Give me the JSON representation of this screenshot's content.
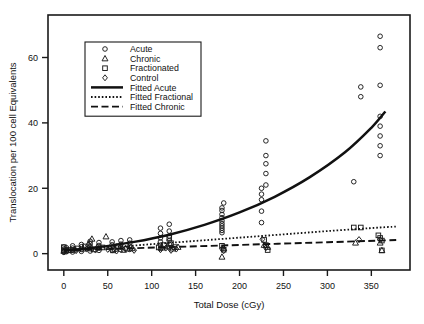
{
  "chart_data": {
    "type": "scatter",
    "title": "",
    "xlabel": "Total Dose (cGy)",
    "ylabel": "Translocation per 100 cell Equivalents",
    "xlim": [
      -18,
      394
    ],
    "ylim": [
      -5,
      73
    ],
    "xticks": [
      0,
      50,
      100,
      150,
      200,
      250,
      300,
      350
    ],
    "yticks": [
      0,
      20,
      40,
      60
    ],
    "grid": false,
    "legend_position": "upper-left",
    "legend": [
      {
        "label": "Acute",
        "marker": "circle",
        "kind": "marker"
      },
      {
        "label": "Chronic",
        "marker": "triangle",
        "kind": "marker"
      },
      {
        "label": "Fractionated",
        "marker": "square",
        "kind": "marker"
      },
      {
        "label": "Control",
        "marker": "diamond",
        "kind": "marker"
      },
      {
        "label": "Fitted Acute",
        "line": "solid",
        "kind": "line"
      },
      {
        "label": "Fitted Fractional",
        "line": "dotted",
        "kind": "line"
      },
      {
        "label": "Fitted Chronic",
        "line": "dashed",
        "kind": "line"
      }
    ],
    "series": [
      {
        "name": "Acute",
        "marker": "circle",
        "points": [
          [
            0,
            0.4
          ],
          [
            0,
            0.9
          ],
          [
            0,
            1.4
          ],
          [
            0,
            2.0
          ],
          [
            3,
            0.6
          ],
          [
            3,
            1.2
          ],
          [
            3,
            1.8
          ],
          [
            10,
            0.5
          ],
          [
            10,
            1.1
          ],
          [
            10,
            1.7
          ],
          [
            10,
            2.4
          ],
          [
            20,
            0.7
          ],
          [
            20,
            1.3
          ],
          [
            20,
            2.1
          ],
          [
            20,
            2.8
          ],
          [
            30,
            0.8
          ],
          [
            30,
            1.5
          ],
          [
            30,
            2.2
          ],
          [
            30,
            3.0
          ],
          [
            30,
            3.8
          ],
          [
            40,
            1.0
          ],
          [
            40,
            1.7
          ],
          [
            40,
            2.5
          ],
          [
            40,
            3.4
          ],
          [
            55,
            1.0
          ],
          [
            55,
            1.9
          ],
          [
            55,
            2.7
          ],
          [
            55,
            3.6
          ],
          [
            65,
            1.2
          ],
          [
            65,
            2.0
          ],
          [
            65,
            2.9
          ],
          [
            65,
            4.0
          ],
          [
            75,
            1.3
          ],
          [
            75,
            2.2
          ],
          [
            75,
            3.2
          ],
          [
            75,
            4.2
          ],
          [
            110,
            1.6
          ],
          [
            110,
            2.6
          ],
          [
            110,
            3.6
          ],
          [
            110,
            4.8
          ],
          [
            110,
            6.2
          ],
          [
            110,
            7.8
          ],
          [
            120,
            1.8
          ],
          [
            120,
            2.9
          ],
          [
            120,
            4.0
          ],
          [
            120,
            5.4
          ],
          [
            120,
            6.9
          ],
          [
            120,
            9.0
          ],
          [
            180,
            6.4
          ],
          [
            180,
            7.1
          ],
          [
            180,
            7.8
          ],
          [
            180,
            8.5
          ],
          [
            180,
            9.2
          ],
          [
            180,
            10.0
          ],
          [
            180,
            11.0
          ],
          [
            180,
            12.0
          ],
          [
            180,
            13.2
          ],
          [
            180,
            14.0
          ],
          [
            182,
            15.5
          ],
          [
            225,
            9.5
          ],
          [
            225,
            13.0
          ],
          [
            225,
            16.5
          ],
          [
            225,
            18.2
          ],
          [
            225,
            20.0
          ],
          [
            230,
            21.0
          ],
          [
            230,
            24.5
          ],
          [
            230,
            27.5
          ],
          [
            230,
            30.0
          ],
          [
            230,
            34.5
          ],
          [
            330,
            22.0
          ],
          [
            338,
            48.0
          ],
          [
            338,
            51.0
          ],
          [
            360,
            30.0
          ],
          [
            360,
            33.0
          ],
          [
            360,
            36.0
          ],
          [
            360,
            39.0
          ],
          [
            360,
            42.0
          ],
          [
            360,
            51.5
          ],
          [
            360,
            63.0
          ],
          [
            360,
            66.5
          ]
        ]
      },
      {
        "name": "Chronic",
        "marker": "triangle",
        "points": [
          [
            0,
            0.8
          ],
          [
            5,
            1.0
          ],
          [
            12,
            1.2
          ],
          [
            22,
            1.5
          ],
          [
            28,
            3.0
          ],
          [
            32,
            4.5
          ],
          [
            38,
            2.0
          ],
          [
            48,
            5.2
          ],
          [
            58,
            1.4
          ],
          [
            68,
            1.1
          ],
          [
            78,
            1.6
          ],
          [
            112,
            1.8
          ],
          [
            118,
            2.2
          ],
          [
            124,
            1.5
          ],
          [
            130,
            2.0
          ],
          [
            180,
            -1.0
          ],
          [
            182,
            1.6
          ],
          [
            228,
            2.6
          ],
          [
            232,
            2.0
          ],
          [
            332,
            3.3
          ],
          [
            360,
            3.3
          ],
          [
            362,
            1.0
          ]
        ]
      },
      {
        "name": "Fractionated",
        "marker": "square",
        "points": [
          [
            0,
            1.0
          ],
          [
            0,
            2.0
          ],
          [
            8,
            1.1
          ],
          [
            16,
            1.6
          ],
          [
            24,
            2.2
          ],
          [
            34,
            1.3
          ],
          [
            44,
            1.9
          ],
          [
            56,
            1.0
          ],
          [
            62,
            2.3
          ],
          [
            72,
            1.5
          ],
          [
            108,
            1.9
          ],
          [
            114,
            2.6
          ],
          [
            120,
            4.8
          ],
          [
            122,
            3.2
          ],
          [
            126,
            2.0
          ],
          [
            180,
            2.4
          ],
          [
            182,
            1.2
          ],
          [
            228,
            4.2
          ],
          [
            230,
            2.6
          ],
          [
            232,
            1.1
          ],
          [
            330,
            8.0
          ],
          [
            338,
            8.0
          ],
          [
            358,
            5.6
          ],
          [
            360,
            4.8
          ],
          [
            362,
            4.0
          ],
          [
            362,
            1.0
          ]
        ]
      },
      {
        "name": "Control",
        "marker": "diamond",
        "points": [
          [
            0,
            0.6
          ],
          [
            4,
            1.0
          ],
          [
            14,
            0.9
          ],
          [
            26,
            1.4
          ],
          [
            36,
            1.1
          ],
          [
            50,
            1.3
          ],
          [
            60,
            0.8
          ],
          [
            70,
            1.5
          ],
          [
            80,
            1.0
          ],
          [
            110,
            1.2
          ],
          [
            116,
            1.7
          ],
          [
            122,
            1.0
          ],
          [
            128,
            1.4
          ],
          [
            180,
            1.5
          ],
          [
            182,
            0.9
          ],
          [
            226,
            4.4
          ],
          [
            230,
            1.8
          ],
          [
            336,
            4.3
          ],
          [
            360,
            4.3
          ]
        ]
      }
    ],
    "fits": [
      {
        "name": "Fitted Acute",
        "style": "solid",
        "x": [
          0,
          40,
          80,
          120,
          160,
          200,
          240,
          280,
          320,
          350,
          366
        ],
        "y": [
          1.0,
          2.0,
          3.6,
          5.8,
          8.8,
          12.6,
          17.4,
          23.4,
          31.0,
          38.5,
          43.5
        ]
      },
      {
        "name": "Fitted Fractional",
        "style": "dotted",
        "x": [
          0,
          60,
          120,
          180,
          240,
          300,
          360,
          380
        ],
        "y": [
          1.0,
          2.1,
          3.3,
          4.5,
          5.7,
          6.9,
          8.0,
          8.3
        ]
      },
      {
        "name": "Fitted Chronic",
        "style": "dashed",
        "x": [
          0,
          60,
          120,
          180,
          240,
          300,
          360,
          380
        ],
        "y": [
          1.0,
          1.5,
          2.0,
          2.5,
          3.0,
          3.5,
          4.0,
          4.2
        ]
      }
    ]
  }
}
